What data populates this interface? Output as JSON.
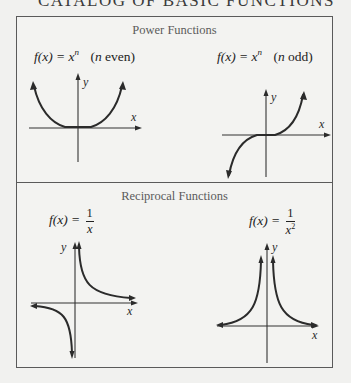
{
  "page": {
    "heading": "CATALOG OF BASIC FUNCTIONS"
  },
  "colors": {
    "background": "#f1f1ef",
    "border": "#5a5a5a",
    "section_title": "#5b5b5b",
    "curve": "#2b2b2b"
  },
  "sections": [
    {
      "title": "Power Functions",
      "graphs": [
        {
          "id": "power-even",
          "formula_lhs": "f(x) = x",
          "formula_exp": "n",
          "formula_note_var": "n",
          "formula_note_text": " even)",
          "axis_x_label": "x",
          "axis_y_label": "y",
          "function": "x^n (n even)"
        },
        {
          "id": "power-odd",
          "formula_lhs": "f(x) = x",
          "formula_exp": "n",
          "formula_note_var": "n",
          "formula_note_text": " odd)",
          "axis_x_label": "x",
          "axis_y_label": "y",
          "function": "x^n (n odd)"
        }
      ]
    },
    {
      "title": "Reciprocal Functions",
      "graphs": [
        {
          "id": "reciprocal-1",
          "formula_lhs": "f(x) = ",
          "numerator": "1",
          "denominator": "x",
          "denominator_exp": "",
          "axis_x_label": "x",
          "axis_y_label": "y",
          "function": "1/x"
        },
        {
          "id": "reciprocal-2",
          "formula_lhs": "f(x) = ",
          "numerator": "1",
          "denominator": "x",
          "denominator_exp": "2",
          "axis_x_label": "x",
          "axis_y_label": "y",
          "function": "1/x^2"
        }
      ]
    }
  ]
}
